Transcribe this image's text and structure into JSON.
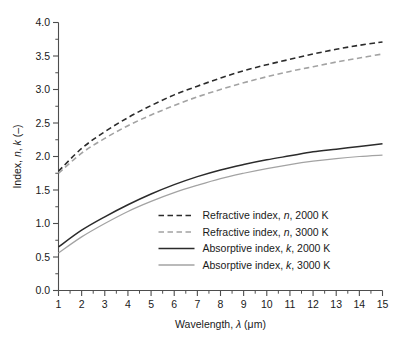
{
  "chart_data": {
    "type": "line",
    "title": "",
    "xlabel": "Wavelength, λ (μm)",
    "ylabel": "Index, n, k (–)",
    "xlim": [
      1,
      15
    ],
    "ylim": [
      0.0,
      4.0
    ],
    "grid": false,
    "legend_position": "center-right-inside",
    "x_ticks": [
      1,
      2,
      3,
      4,
      5,
      6,
      7,
      8,
      9,
      10,
      11,
      12,
      13,
      14,
      15
    ],
    "x_tick_labels": [
      "1",
      "2",
      "3",
      "4",
      "5",
      "6",
      "7",
      "8",
      "9",
      "10",
      "11",
      "12",
      "13",
      "14",
      "15"
    ],
    "x_minor_ticks": [
      1.5,
      2.5,
      3.5,
      4.5,
      5.5,
      6.5,
      7.5,
      8.5,
      9.5,
      10.5,
      11.5,
      12.5,
      13.5,
      14.5
    ],
    "y_ticks": [
      0.0,
      0.5,
      1.0,
      1.5,
      2.0,
      2.5,
      3.0,
      3.5,
      4.0
    ],
    "y_tick_labels": [
      "0.0",
      "0.5",
      "1.0",
      "1.5",
      "2.0",
      "2.5",
      "3.0",
      "3.5",
      "4.0"
    ],
    "y_minor_ticks": [
      0.25,
      0.75,
      1.25,
      1.75,
      2.25,
      2.75,
      3.25,
      3.75
    ],
    "x": [
      1,
      2,
      3,
      4,
      5,
      6,
      7,
      8,
      9,
      10,
      11,
      12,
      13,
      14,
      15
    ],
    "series": [
      {
        "name": "Refractive index, n, 2000 K",
        "label_parts": [
          "Refractive index, ",
          "n",
          ", 2000 K"
        ],
        "italic_part": "n",
        "style": "dashed",
        "color": "#2b2b2b",
        "values": [
          1.78,
          2.12,
          2.37,
          2.58,
          2.76,
          2.92,
          3.05,
          3.17,
          3.28,
          3.37,
          3.45,
          3.53,
          3.6,
          3.66,
          3.71
        ]
      },
      {
        "name": "Refractive index, n, 3000 K",
        "label_parts": [
          "Refractive index, ",
          "n",
          ", 3000 K"
        ],
        "italic_part": "n",
        "style": "dashed",
        "color": "#a3a3a3",
        "values": [
          1.75,
          2.05,
          2.27,
          2.46,
          2.62,
          2.76,
          2.89,
          3.0,
          3.1,
          3.19,
          3.27,
          3.34,
          3.41,
          3.47,
          3.53
        ]
      },
      {
        "name": "Absorptive index, k, 2000 K",
        "label_parts": [
          "Absorptive index, ",
          "k",
          ", 2000 K"
        ],
        "italic_part": "k",
        "style": "solid",
        "color": "#2b2b2b",
        "values": [
          0.65,
          0.9,
          1.1,
          1.28,
          1.44,
          1.58,
          1.7,
          1.8,
          1.88,
          1.95,
          2.01,
          2.07,
          2.11,
          2.15,
          2.19
        ]
      },
      {
        "name": "Absorptive index, k, 3000 K",
        "label_parts": [
          "Absorptive index, ",
          "k",
          ", 3000 K"
        ],
        "italic_part": "k",
        "style": "solid",
        "color": "#a3a3a3",
        "values": [
          0.56,
          0.8,
          1.0,
          1.18,
          1.33,
          1.46,
          1.57,
          1.67,
          1.75,
          1.82,
          1.88,
          1.93,
          1.97,
          2.0,
          2.02
        ]
      }
    ]
  },
  "legend": {
    "entries": [
      {
        "text": "Refractive index, ",
        "sym": "n",
        "tail": ", 2000 K"
      },
      {
        "text": "Refractive index, ",
        "sym": "n",
        "tail": ", 3000 K"
      },
      {
        "text": "Absorptive index, ",
        "sym": "k",
        "tail": ", 2000 K"
      },
      {
        "text": "Absorptive index, ",
        "sym": "k",
        "tail": ", 3000 K"
      }
    ]
  },
  "axes": {
    "x_title_pre": "Wavelength, ",
    "x_title_sym": "λ",
    "x_title_unit": " (μm)",
    "y_title_pre": "Index, ",
    "y_title_n": "n",
    "y_title_mid": ", ",
    "y_title_k": "k",
    "y_title_unit": " (–)"
  },
  "colors": {
    "dark": "#2b2b2b",
    "light": "#a3a3a3",
    "axis": "#4d4d4d",
    "background": "#ffffff"
  }
}
